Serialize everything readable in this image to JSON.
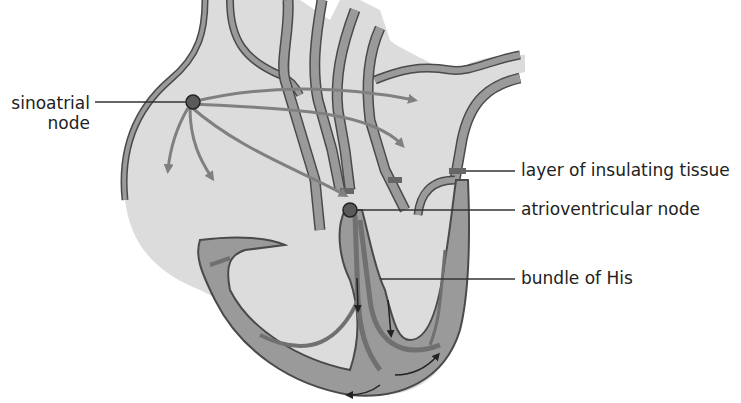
{
  "diagram": {
    "colors": {
      "chamber_fill": "#dcdcdc",
      "wall_fill": "#9a9a9a",
      "wall_stroke": "#4a4a4a",
      "node_fill": "#5a5a5a",
      "arrow_color": "#808080",
      "label_line": "#333333",
      "text": "#222222"
    },
    "labels": [
      {
        "id": "sinoatrial",
        "line1": "sinoatrial",
        "line2": "node"
      },
      {
        "id": "insulating",
        "text": "layer of insulating tissue"
      },
      {
        "id": "av-node",
        "text": "atrioventricular node"
      },
      {
        "id": "his",
        "text": "bundle of His"
      }
    ]
  }
}
